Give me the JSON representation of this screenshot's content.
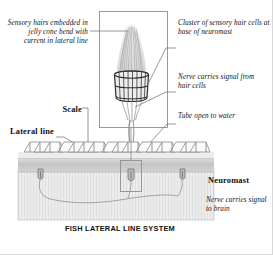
{
  "figure": {
    "caption": "FISH LATERAL LINE SYSTEM",
    "colors": {
      "ink": "#1a1a1a",
      "leader_line": "#7a7a7a",
      "inset_border": "#9a9a9a",
      "skin_band": "#c9c9c9",
      "muscle_band": "#e8e8e8",
      "scale_outline": "#8a8a8a",
      "jelly_cone": "#d9d9d9",
      "page_border": "#d8d8d8"
    }
  },
  "labels": {
    "sensory_hairs": "Sensory hairs embedded in jelly cone bend with current in lateral line",
    "cluster": "Cluster of sensory hair cells at base of neuromast",
    "nerve_from_hair_cells": "Nerve carries signal from hair cells",
    "tube_open": "Tube open to water",
    "scale": "Scale",
    "lateral_line": "Lateral line",
    "neuromast": "Neuromast",
    "nerve_to_brain": "Nerve carries signal to brain"
  }
}
